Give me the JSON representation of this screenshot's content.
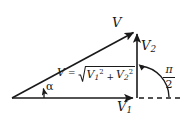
{
  "figure": {
    "type": "vector-addition-right-triangle",
    "background_color": "#ffffff",
    "stroke_color": "#1a1a1a",
    "labels": {
      "resultant": "V",
      "vertical_component": "V",
      "vertical_component_subscript": "2",
      "horizontal_component": "V",
      "horizontal_component_subscript": "1",
      "angle_alpha": "α",
      "right_angle_numerator": "π",
      "right_angle_denominator": "2"
    },
    "formula": {
      "lhs": "V",
      "equals": "=",
      "radical_symbol": "√",
      "term1_base": "V",
      "term1_sub": "1",
      "term1_sup": "2",
      "plus": "+",
      "term2_base": "V",
      "term2_sub": "2",
      "term2_sup": "2",
      "plain_text": "V = √(V₁² + V₂²)"
    },
    "geometry": {
      "origin_x": 12,
      "origin_y": 98,
      "apex_x": 137,
      "apex_y": 30,
      "base_end_x": 137,
      "base_end_y": 98,
      "dashed_end_x": 180,
      "alpha_arc_radius": 30,
      "right_angle_arc_radius": 32
    }
  }
}
